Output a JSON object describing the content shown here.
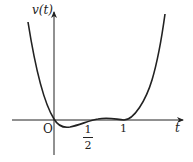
{
  "figure": {
    "y_axis_label": "v(t)",
    "x_axis_label": "t",
    "origin_label": "O",
    "ticks": [
      {
        "numerator": "1",
        "denominator": "2",
        "value": 0.5
      },
      {
        "label": "1",
        "value": 1
      }
    ],
    "curve": {
      "description": "Quartic-like curve: decreasing from top-left through origin, shallow minimum between 0 and 1/2, slight rise to small local maximum between 1/2 and 1, touches axis at t=1, then increases steeply",
      "zeros": [
        0,
        1
      ],
      "color": "#222222"
    }
  }
}
